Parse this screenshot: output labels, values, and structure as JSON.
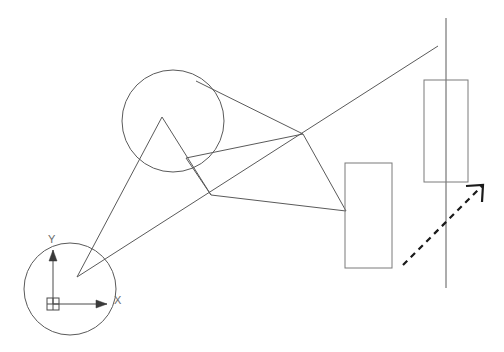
{
  "drawing": {
    "title": "CAD wireframe geometry view",
    "background_color": "#ffffff",
    "line_color": "#5a5a5a",
    "rect_color": "#7a7a7a",
    "accent_color": "#1a1a1a",
    "width": 504,
    "height": 352
  },
  "ucs": {
    "name": "ucs-coordinate-gizmo",
    "origin_x": 53,
    "origin_y": 304,
    "x_axis_label": "X",
    "y_axis_label": "Y",
    "x_axis_end_x": 107,
    "x_axis_end_y": 304,
    "y_axis_end_x": 53,
    "y_axis_end_y": 250,
    "x_label_x": 114,
    "x_label_y": 304,
    "y_label_x": 48,
    "y_label_y": 243,
    "box_x": 47,
    "box_y": 298,
    "box_size": 12
  },
  "circles": [
    {
      "name": "upper-circle",
      "cx": 173,
      "cy": 121,
      "r": 51
    },
    {
      "name": "origin-circle",
      "cx": 70,
      "cy": 289,
      "r": 46
    }
  ],
  "rectangles": [
    {
      "name": "middle-rectangle",
      "x": 345,
      "y": 163,
      "width": 47,
      "height": 105
    },
    {
      "name": "right-rectangle",
      "x": 424,
      "y": 80,
      "width": 44,
      "height": 102
    }
  ],
  "lines": [
    {
      "name": "vertical-reference-line",
      "x1": 446,
      "y1": 18,
      "x2": 446,
      "y2": 288
    },
    {
      "name": "long-diagonal-line",
      "x1": 77,
      "y1": 277,
      "x2": 438,
      "y2": 46
    },
    {
      "name": "apex-to-lower-left-line",
      "x1": 162,
      "y1": 117,
      "x2": 77,
      "y2": 277
    },
    {
      "name": "apex-to-circle-node-line",
      "x1": 162,
      "y1": 117,
      "x2": 211,
      "y2": 195
    },
    {
      "name": "circle-top-to-right-node-line",
      "x1": 196,
      "y1": 81,
      "x2": 303,
      "y2": 134
    },
    {
      "name": "right-node-to-rect-line",
      "x1": 303,
      "y1": 134,
      "x2": 346,
      "y2": 211
    },
    {
      "name": "circle-node-to-right-node-line",
      "x1": 186,
      "y1": 158,
      "x2": 303,
      "y2": 134
    },
    {
      "name": "hub-to-rect-line",
      "x1": 211,
      "y1": 195,
      "x2": 346,
      "y2": 211
    },
    {
      "name": "circle-node-to-hub-line",
      "x1": 186,
      "y1": 158,
      "x2": 211,
      "y2": 195
    }
  ],
  "dashed_arrow": {
    "name": "direction-arrow",
    "x1": 403,
    "y1": 265,
    "x2": 483,
    "y2": 185,
    "head_left_x": 466,
    "head_left_y": 186,
    "head_bottom_x": 482,
    "head_bottom_y": 202
  },
  "nodes": [
    {
      "name": "vertex-lower-left",
      "x": 77,
      "y": 277
    },
    {
      "name": "vertex-apex",
      "x": 162,
      "y": 117
    },
    {
      "name": "vertex-circle-node",
      "x": 186,
      "y": 158
    },
    {
      "name": "vertex-hub",
      "x": 211,
      "y": 195
    },
    {
      "name": "vertex-right-node",
      "x": 303,
      "y": 134
    },
    {
      "name": "vertex-rect-attach",
      "x": 346,
      "y": 211
    }
  ]
}
